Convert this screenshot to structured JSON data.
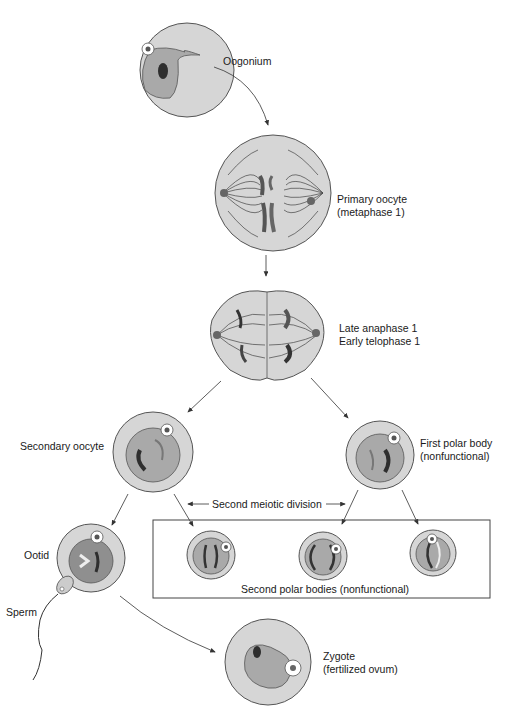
{
  "diagram": {
    "colors": {
      "cytoplasm": "#d6d6d6",
      "nucleus": "#a9a9a9",
      "nucleus_dark": "#8f8f8f",
      "chromatin": "#2e2e2e",
      "outline": "#555555",
      "arrow": "#333333"
    },
    "stages": {
      "oogonium": {
        "label": "Oogonium"
      },
      "primary_oocyte": {
        "line1": "Primary oocyte",
        "line2": "(metaphase 1)"
      },
      "anaphase": {
        "line1": "Late anaphase 1",
        "line2": "Early telophase 1"
      },
      "secondary_oocyte": {
        "label": "Secondary oocyte"
      },
      "first_polar_body": {
        "line1": "First polar body",
        "line2": "(nonfunctional)"
      },
      "second_meiotic_division": {
        "label": "Second meiotic division"
      },
      "second_polar_bodies": {
        "label": "Second polar bodies (nonfunctional)"
      },
      "ootid": {
        "label": "Ootid"
      },
      "sperm": {
        "label": "Sperm"
      },
      "zygote": {
        "line1": "Zygote",
        "line2": "(fertilized ovum)"
      }
    }
  }
}
